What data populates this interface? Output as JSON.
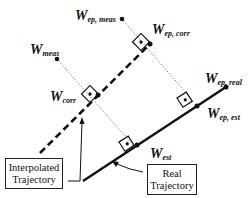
{
  "diagram": {
    "type": "trajectory-correction-geometry",
    "colors": {
      "ink": "#111111",
      "background": "#ffffff"
    },
    "points": {
      "ep_meas": {
        "base": "W",
        "sub": "ep, meas"
      },
      "ep_corr": {
        "base": "W",
        "sub": "ep, corr"
      },
      "meas": {
        "base": "W",
        "sub": "meas"
      },
      "corr": {
        "base": "W",
        "sub": "corr"
      },
      "ep_real": {
        "base": "W",
        "sub": "ep, real"
      },
      "ep_est": {
        "base": "W",
        "sub": "ep, est"
      },
      "est": {
        "base": "W",
        "sub": "est"
      }
    },
    "boxes": {
      "interpolated": {
        "line1": "Interpolated",
        "line2": "Trajectory"
      },
      "real": {
        "line1": "Real",
        "line2": "Trajectory"
      }
    },
    "lines": [
      {
        "name": "interpolated-trajectory",
        "style": "dashed"
      },
      {
        "name": "real-trajectory",
        "style": "solid"
      },
      {
        "name": "projection-ep",
        "style": "dotted"
      },
      {
        "name": "projection-mid",
        "style": "dotted"
      }
    ]
  }
}
